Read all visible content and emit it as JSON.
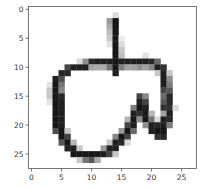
{
  "chart_data": {
    "type": "heatmap",
    "title": "",
    "xlabel": "",
    "ylabel": "",
    "colormap": "gray_r",
    "xlim": [
      -0.5,
      27.5
    ],
    "ylim": [
      27.5,
      -0.5
    ],
    "x_ticks": [
      0,
      5,
      10,
      15,
      20,
      25
    ],
    "y_ticks": [
      0,
      5,
      10,
      15,
      20,
      25
    ],
    "x_tick_labels": [
      "0",
      "5",
      "10",
      "15",
      "20",
      "25"
    ],
    "y_tick_labels": [
      "0",
      "5",
      "10",
      "15",
      "20",
      "25"
    ],
    "rows": 28,
    "cols": 28,
    "pixels": [
      [
        0,
        0,
        0,
        0,
        0,
        0,
        0,
        0,
        0,
        0,
        0,
        0,
        0,
        0,
        0,
        0,
        0,
        0,
        0,
        0,
        0,
        0,
        0,
        0,
        0,
        0,
        0,
        0
      ],
      [
        0,
        0,
        0,
        0,
        0,
        0,
        0,
        0,
        0,
        0,
        0,
        0,
        0,
        0,
        40,
        0,
        0,
        0,
        0,
        0,
        0,
        0,
        0,
        0,
        0,
        0,
        0,
        0
      ],
      [
        0,
        0,
        0,
        0,
        0,
        0,
        0,
        0,
        0,
        0,
        0,
        0,
        0,
        110,
        250,
        0,
        0,
        0,
        0,
        0,
        0,
        0,
        0,
        0,
        0,
        0,
        0,
        0
      ],
      [
        0,
        0,
        0,
        0,
        0,
        0,
        0,
        0,
        0,
        0,
        0,
        0,
        0,
        90,
        250,
        0,
        0,
        0,
        0,
        0,
        0,
        0,
        0,
        0,
        0,
        0,
        0,
        0
      ],
      [
        0,
        0,
        0,
        0,
        0,
        0,
        0,
        0,
        0,
        0,
        0,
        0,
        0,
        70,
        250,
        0,
        0,
        0,
        0,
        0,
        0,
        0,
        0,
        0,
        0,
        0,
        0,
        0
      ],
      [
        0,
        0,
        0,
        0,
        0,
        0,
        0,
        0,
        0,
        0,
        0,
        0,
        0,
        60,
        250,
        20,
        0,
        0,
        0,
        0,
        0,
        0,
        0,
        0,
        0,
        0,
        0,
        0
      ],
      [
        0,
        0,
        0,
        0,
        0,
        0,
        0,
        0,
        0,
        0,
        0,
        0,
        0,
        30,
        250,
        40,
        0,
        0,
        0,
        0,
        0,
        0,
        0,
        0,
        0,
        0,
        0,
        0
      ],
      [
        0,
        0,
        0,
        0,
        0,
        0,
        0,
        0,
        0,
        0,
        0,
        0,
        0,
        0,
        250,
        60,
        0,
        0,
        0,
        0,
        0,
        0,
        0,
        0,
        0,
        0,
        0,
        0
      ],
      [
        0,
        0,
        0,
        0,
        0,
        0,
        0,
        0,
        0,
        0,
        0,
        0,
        0,
        0,
        250,
        70,
        0,
        0,
        0,
        30,
        0,
        0,
        0,
        0,
        0,
        0,
        0,
        0
      ],
      [
        0,
        0,
        0,
        0,
        0,
        0,
        0,
        0,
        40,
        120,
        230,
        240,
        240,
        240,
        250,
        240,
        240,
        240,
        240,
        240,
        230,
        160,
        0,
        0,
        0,
        0,
        0,
        0
      ],
      [
        0,
        0,
        0,
        0,
        0,
        0,
        200,
        240,
        240,
        240,
        100,
        90,
        90,
        150,
        250,
        140,
        100,
        100,
        120,
        100,
        130,
        240,
        220,
        0,
        0,
        0,
        0,
        0
      ],
      [
        0,
        0,
        0,
        0,
        0,
        230,
        230,
        0,
        0,
        0,
        0,
        0,
        0,
        0,
        240,
        0,
        0,
        0,
        0,
        0,
        0,
        60,
        240,
        60,
        0,
        0,
        0,
        0
      ],
      [
        0,
        0,
        0,
        0,
        240,
        190,
        0,
        0,
        0,
        0,
        0,
        0,
        0,
        0,
        0,
        0,
        0,
        0,
        0,
        0,
        0,
        0,
        240,
        120,
        0,
        0,
        0,
        0
      ],
      [
        0,
        0,
        0,
        30,
        250,
        150,
        0,
        0,
        0,
        0,
        0,
        0,
        0,
        0,
        0,
        0,
        0,
        0,
        0,
        0,
        0,
        0,
        240,
        140,
        0,
        0,
        0,
        0
      ],
      [
        0,
        0,
        0,
        60,
        250,
        130,
        0,
        0,
        0,
        0,
        0,
        0,
        0,
        0,
        0,
        0,
        0,
        0,
        0,
        0,
        0,
        0,
        200,
        180,
        0,
        0,
        0,
        0
      ],
      [
        0,
        0,
        0,
        60,
        250,
        230,
        0,
        0,
        0,
        0,
        0,
        0,
        0,
        0,
        0,
        0,
        0,
        0,
        200,
        130,
        0,
        0,
        160,
        230,
        0,
        0,
        0,
        0
      ],
      [
        0,
        0,
        0,
        30,
        250,
        240,
        0,
        0,
        0,
        0,
        0,
        0,
        0,
        0,
        0,
        0,
        0,
        0,
        240,
        200,
        0,
        0,
        180,
        230,
        0,
        0,
        0,
        0
      ],
      [
        0,
        0,
        0,
        0,
        250,
        240,
        0,
        0,
        0,
        0,
        0,
        0,
        0,
        0,
        0,
        0,
        0,
        140,
        250,
        240,
        0,
        0,
        220,
        220,
        40,
        0,
        0,
        0
      ],
      [
        0,
        0,
        0,
        0,
        250,
        240,
        0,
        0,
        0,
        0,
        0,
        0,
        0,
        0,
        0,
        0,
        0,
        240,
        220,
        250,
        80,
        0,
        100,
        240,
        0,
        0,
        0,
        0
      ],
      [
        0,
        0,
        0,
        0,
        250,
        240,
        0,
        0,
        0,
        0,
        0,
        0,
        0,
        0,
        0,
        0,
        80,
        250,
        120,
        250,
        150,
        40,
        240,
        230,
        0,
        0,
        0,
        0
      ],
      [
        0,
        0,
        0,
        0,
        250,
        240,
        0,
        0,
        0,
        0,
        0,
        0,
        0,
        0,
        0,
        0,
        200,
        240,
        0,
        120,
        240,
        230,
        240,
        140,
        0,
        0,
        0,
        0
      ],
      [
        0,
        0,
        0,
        0,
        190,
        250,
        60,
        0,
        0,
        0,
        0,
        0,
        0,
        0,
        0,
        110,
        250,
        160,
        0,
        0,
        240,
        250,
        250,
        0,
        0,
        0,
        0,
        0
      ],
      [
        0,
        0,
        0,
        0,
        0,
        250,
        200,
        0,
        0,
        0,
        0,
        0,
        0,
        0,
        130,
        250,
        200,
        0,
        0,
        0,
        0,
        220,
        230,
        0,
        0,
        0,
        0,
        0
      ],
      [
        0,
        0,
        0,
        0,
        0,
        180,
        250,
        80,
        0,
        0,
        0,
        0,
        0,
        60,
        240,
        230,
        40,
        0,
        0,
        0,
        0,
        0,
        0,
        0,
        0,
        0,
        0,
        0
      ],
      [
        0,
        0,
        0,
        0,
        0,
        0,
        240,
        240,
        60,
        0,
        0,
        0,
        110,
        240,
        240,
        0,
        0,
        0,
        0,
        0,
        0,
        0,
        0,
        0,
        0,
        0,
        0,
        0
      ],
      [
        0,
        0,
        0,
        0,
        0,
        0,
        0,
        250,
        250,
        250,
        250,
        250,
        240,
        200,
        60,
        0,
        0,
        0,
        0,
        0,
        0,
        0,
        0,
        0,
        0,
        0,
        0,
        0
      ],
      [
        0,
        0,
        0,
        0,
        0,
        0,
        0,
        0,
        60,
        150,
        180,
        90,
        0,
        0,
        0,
        0,
        0,
        0,
        0,
        0,
        0,
        0,
        0,
        0,
        0,
        0,
        0,
        0
      ],
      [
        0,
        0,
        0,
        0,
        0,
        0,
        0,
        0,
        0,
        0,
        0,
        0,
        0,
        0,
        0,
        0,
        0,
        0,
        0,
        0,
        0,
        0,
        0,
        0,
        0,
        0,
        0,
        0
      ]
    ]
  }
}
